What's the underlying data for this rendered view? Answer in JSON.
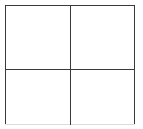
{
  "figure": {
    "name": "two-by-two-grid",
    "background_color": "#ffffff",
    "line_color": "#3a3a3a",
    "faint_line_color": "#dcdcdc",
    "rows": 2,
    "columns": 2,
    "border": {
      "top_label": "",
      "left_label": "",
      "right_label": "",
      "bottom_label": ""
    },
    "dividers": {
      "vertical_label": "",
      "horizontal_label": ""
    },
    "cells": [
      {
        "id": "top-left",
        "label": ""
      },
      {
        "id": "top-right",
        "label": ""
      },
      {
        "id": "bottom-left",
        "label": ""
      },
      {
        "id": "bottom-right",
        "label": ""
      }
    ]
  }
}
